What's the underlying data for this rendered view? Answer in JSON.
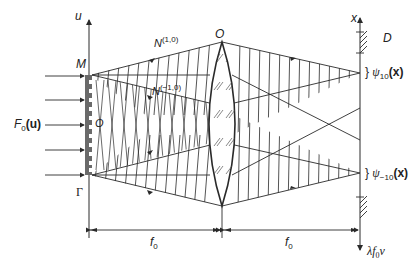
{
  "figure": {
    "type": "optical-system-diagram"
  },
  "labels": {
    "u_axis": "u",
    "x_axis": "x",
    "grating_top": "M",
    "grating_center": "O",
    "grating_bottom": "Γ",
    "input_field": "F",
    "input_field_sub": "0",
    "input_field_arg": "(u)",
    "lens_center": "O",
    "beam_upper": "N",
    "beam_upper_order": "(1,0)",
    "beam_lower": "N",
    "beam_lower_order": "(−1,0)",
    "stop": "D",
    "focus_upper": "ψ",
    "focus_upper_sub": "10",
    "focus_upper_arg": "(x)",
    "focus_lower": "ψ",
    "focus_lower_sub": "−10",
    "focus_lower_arg": "(x)",
    "focal_left": "f",
    "focal_left_sub": "0",
    "focal_right": "f",
    "focal_right_sub": "0",
    "freq_axis": "λf",
    "freq_axis_sub": "0",
    "freq_axis_var": "ν",
    "brace": "}"
  },
  "colors": {
    "line": "#2a2a2a",
    "grating": "#6a6a6a",
    "background": "#ffffff"
  }
}
